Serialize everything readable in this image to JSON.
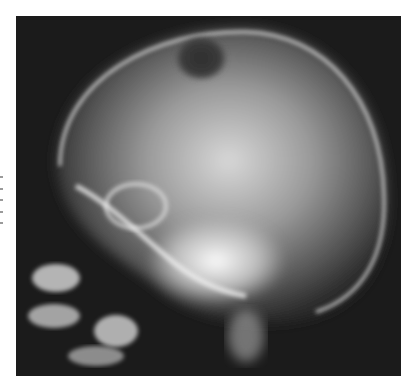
{
  "figure": {
    "colors": {
      "background": "#ffffff",
      "film": "#1b1b1b",
      "bone_bright": "#f2f2f2",
      "lesion": "#3a3a3a"
    }
  },
  "margin_text": {
    "legible": false
  }
}
